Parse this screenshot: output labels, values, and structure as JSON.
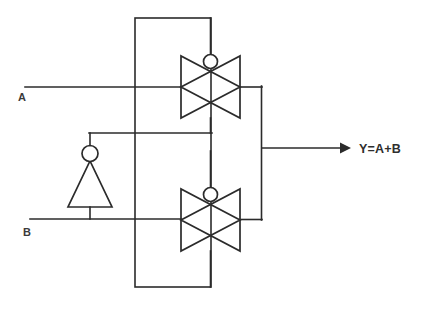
{
  "diagram": {
    "background_color": "#ffffff",
    "line_color": "#2b2b2b",
    "label_color": "#3a3a3a",
    "width": 425,
    "height": 311,
    "labels": {
      "input_a": "A",
      "input_b": "B",
      "output": "Y=A+B"
    },
    "components": {
      "control_bus_rectangle": "control-bus-rectangle",
      "top_transmission_gate": "transmission-gate-top",
      "bottom_transmission_gate": "transmission-gate-bottom",
      "inverter": "inverter-gate",
      "output_bus": "output-bus",
      "output_arrow": "output-arrow"
    },
    "icons": {
      "inverter_bubble": "inversion-bubble-icon",
      "top_gate_bubble": "inversion-bubble-icon",
      "bottom_gate_bubble": "inversion-bubble-icon",
      "arrow": "arrow-right-icon"
    }
  }
}
